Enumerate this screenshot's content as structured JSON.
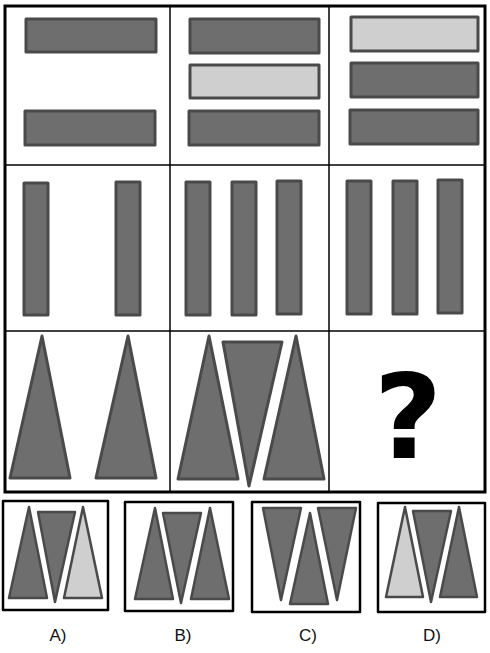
{
  "colors": {
    "dark_fill": "#6e6e6e",
    "light_fill": "#cfcfcf",
    "shape_stroke": "#4a4a4a",
    "grid_line": "#000000",
    "question_mark": "#000000"
  },
  "puzzle": {
    "question_symbol": "?",
    "rows": [
      {
        "name": "horizontal-bars",
        "cells": [
          "2 dark bars (top, bottom)",
          "dark, light, dark bars",
          "light, dark, dark bars"
        ]
      },
      {
        "name": "vertical-bars",
        "cells": [
          "2 dark bars",
          "3 dark bars",
          "3 dark bars"
        ]
      },
      {
        "name": "triangles",
        "cells": [
          "2 dark upward triangles",
          "dark up, dark down, dark up triangles",
          "?"
        ]
      }
    ]
  },
  "options": [
    {
      "id": "A",
      "label": "A)",
      "shapes": [
        "dark up",
        "dark down",
        "light up"
      ]
    },
    {
      "id": "B",
      "label": "B)",
      "shapes": [
        "dark up",
        "dark down",
        "dark up"
      ]
    },
    {
      "id": "C",
      "label": "C)",
      "shapes": [
        "dark down",
        "dark up",
        "dark down"
      ]
    },
    {
      "id": "D",
      "label": "D)",
      "shapes": [
        "light up",
        "dark down",
        "dark up"
      ]
    }
  ]
}
